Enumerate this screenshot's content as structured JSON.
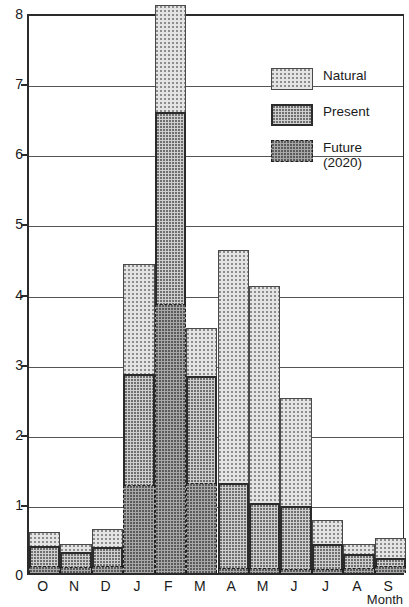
{
  "chart_data": {
    "type": "bar",
    "stacked": true,
    "title": "",
    "xlabel": "Month",
    "ylabel": "",
    "ylim": [
      0,
      8
    ],
    "ytick_labels": [
      "0",
      "1",
      "2",
      "3",
      "4",
      "5",
      "6",
      "7",
      "8"
    ],
    "ytick_values": [
      0,
      1,
      2,
      3,
      4,
      5,
      6,
      7,
      8
    ],
    "grid": "horizontal",
    "categories": [
      "O",
      "N",
      "D",
      "J",
      "F",
      "M",
      "A",
      "M",
      "J",
      "J",
      "A",
      "S"
    ],
    "legend_position": "top-right",
    "series": [
      {
        "name": "Natural",
        "values": [
          0.59,
          0.41,
          0.63,
          4.41,
          8.1,
          3.5,
          4.61,
          4.1,
          2.5,
          0.76,
          0.41,
          0.5
        ]
      },
      {
        "name": "Present",
        "values": [
          0.39,
          0.3,
          0.37,
          2.84,
          6.58,
          2.81,
          1.28,
          1.0,
          0.96,
          0.41,
          0.27,
          0.21
        ]
      },
      {
        "name": "Future (2020)",
        "values": [
          0.1,
          0.09,
          0.1,
          1.26,
          3.83,
          1.28,
          0.07,
          0.07,
          0.06,
          0.06,
          0.07,
          0.1
        ]
      }
    ]
  },
  "legend": {
    "items": [
      {
        "label": "Natural",
        "swatch": "natural-swatch"
      },
      {
        "label": "Present",
        "swatch": "present-swatch"
      },
      {
        "label": "Future\n(2020)",
        "swatch": "future-swatch"
      }
    ]
  },
  "colors": {
    "axis": "#2b2b2b",
    "grid": "#555555",
    "natural_fill": "#e4e4e4",
    "present_fill": "#cfcfcf",
    "future_fill": "#a8a8a8",
    "background": "#ffffff"
  }
}
